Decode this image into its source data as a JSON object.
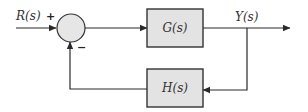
{
  "diagram": {
    "type": "feedback-control-block-diagram",
    "input": {
      "label": "R(s)",
      "sign": "+"
    },
    "summing_junction": {
      "feedback_sign": "−"
    },
    "forward_block": {
      "label": "G(s)"
    },
    "output": {
      "label": "Y(s)"
    },
    "feedback_block": {
      "label": "H(s)"
    },
    "colors": {
      "line": "#2a2a2a",
      "block_fill": "#e3e3e3",
      "block_stroke": "#333333",
      "junction_fill": "#e6e6e6"
    }
  }
}
